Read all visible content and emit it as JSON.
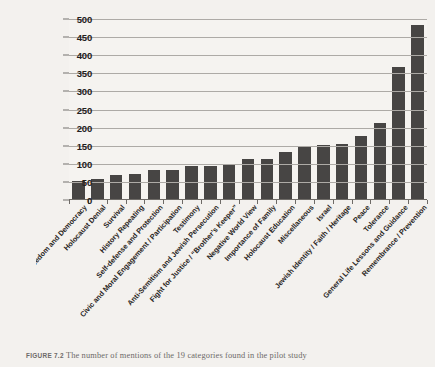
{
  "figure": {
    "caption_label": "FIGURE 7.2",
    "caption_text": "The number of mentions of the 19 categories found in the pilot study"
  },
  "chart_data": {
    "type": "bar",
    "title": "",
    "xlabel": "",
    "ylabel": "Number of Mentions",
    "ylim": [
      0,
      500
    ],
    "ytick_step": 50,
    "ytick_labels": [
      "0",
      "50",
      "100",
      "150",
      "200",
      "250",
      "300",
      "350",
      "400",
      "450",
      "500"
    ],
    "grid": true,
    "legend": "none",
    "bar_color": "#474544",
    "plot_background": "#f5f3f0",
    "categories": [
      "Freedom and Democracy",
      "Holocaust Denial",
      "Survival",
      "History Repeating",
      "Self-defense and Protection",
      "Civic and Moral Engagement / Participation",
      "Testimony",
      "Anti-Semitism and Jewish Persecution",
      "Fight for Justice / “Brother’s Keeper”",
      "Negative World View",
      "Importance of Family",
      "Holocaust Education",
      "Miscellaneous",
      "Israel",
      "Jewish Identity / Faith / Heritage",
      "Peace",
      "Tolerance",
      "General Life Lessons and Guidance",
      "Remembrance / Prevention"
    ],
    "values": [
      52,
      58,
      68,
      73,
      84,
      84,
      93,
      94,
      97,
      112,
      114,
      132,
      148,
      152,
      155,
      178,
      213,
      367,
      483
    ]
  }
}
